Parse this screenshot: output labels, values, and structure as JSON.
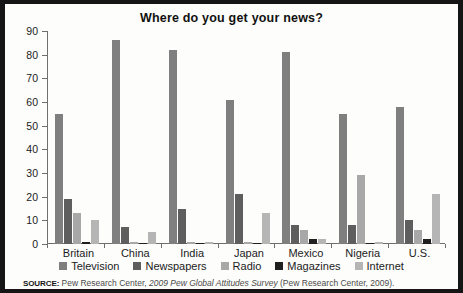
{
  "chart_data": {
    "type": "bar",
    "title": "Where do you get your news?",
    "xlabel": "",
    "ylabel": "",
    "ylim": [
      0,
      90
    ],
    "ytick_step": 10,
    "yticks": [
      "0",
      "10",
      "20",
      "30",
      "40",
      "50",
      "60",
      "70",
      "80",
      "90"
    ],
    "grid": false,
    "legend_position": "bottom",
    "categories": [
      "Britain",
      "China",
      "India",
      "Japan",
      "Mexico",
      "Nigeria",
      "U.S."
    ],
    "series": [
      {
        "name": "Television",
        "color": "#7f7f7f",
        "values": [
          55,
          86,
          82,
          61,
          81,
          55,
          58
        ]
      },
      {
        "name": "Newspapers",
        "color": "#5e5e5e",
        "values": [
          19,
          7,
          15,
          21,
          8,
          8,
          10
        ]
      },
      {
        "name": "Radio",
        "color": "#a8a8a8",
        "values": [
          13,
          1,
          1,
          1,
          6,
          29,
          6
        ]
      },
      {
        "name": "Magazines",
        "color": "#1f1f1f",
        "values": [
          1,
          0,
          0,
          0,
          2,
          0,
          2
        ]
      },
      {
        "name": "Internet",
        "color": "#b5b5b5",
        "values": [
          10,
          5,
          1,
          13,
          2,
          1,
          21
        ]
      }
    ]
  },
  "source": {
    "label": "SOURCE:",
    "text_before": " Pew Research Center, ",
    "italic": "2009 Pew Global Attitudes Survey",
    "text_after": " (Pew Research Center, 2009)."
  },
  "colors": {
    "border": "#151515",
    "background": "#fdfdfb",
    "axis": "#6f6f6f",
    "text": "#1b1b1b"
  }
}
